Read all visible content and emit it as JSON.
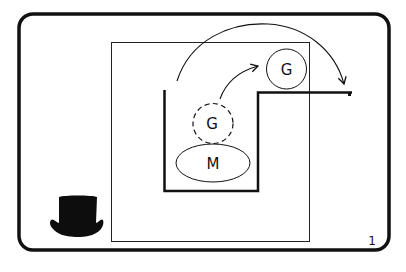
{
  "diagram": {
    "type": "conceptual-illustration",
    "elements": {
      "moved_circle": {
        "label": "G",
        "style": "solid"
      },
      "origin_circle": {
        "label": "G",
        "style": "dashed"
      },
      "ellipse": {
        "label": "M"
      },
      "hat_icon": "top-hat-icon",
      "page_number": "1"
    },
    "arrows": [
      {
        "from": "dashed G circle",
        "to": "solid G circle",
        "style": "curved"
      },
      {
        "from": "top of stepped line region",
        "to": "right end of stepped line",
        "style": "large arc"
      }
    ],
    "colors": {
      "stroke": "#111111",
      "background": "#ffffff"
    }
  }
}
